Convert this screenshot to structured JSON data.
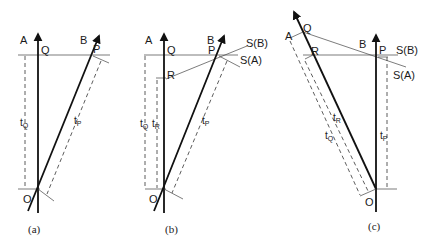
{
  "figure": {
    "panels": [
      {
        "caption": "(a)",
        "labels": {
          "A": "A",
          "B": "B",
          "Q": "Q",
          "P": "P",
          "O": "O",
          "tQ": "t",
          "tQ_sub": "Q",
          "tP": "t",
          "tP_sub": "P"
        }
      },
      {
        "caption": "(b)",
        "labels": {
          "A": "A",
          "B": "B",
          "Q": "Q",
          "P": "P",
          "R": "R",
          "O": "O",
          "SB": "S(B)",
          "SA": "S(A)",
          "tQ": "t",
          "tQ_sub": "Q",
          "tR": "t",
          "tR_sub": "R",
          "tP": "t",
          "tP_sub": "P"
        }
      },
      {
        "caption": "(c)",
        "labels": {
          "A": "A",
          "B": "B",
          "Q": "Q",
          "P": "P",
          "R": "R",
          "O": "O",
          "SB": "S(B)",
          "SA": "S(A)",
          "tR": "t",
          "tR_sub": "R",
          "tQ": "t",
          "tQ_sub": "Q",
          "tP": "t",
          "tP_sub": "P"
        }
      }
    ]
  }
}
